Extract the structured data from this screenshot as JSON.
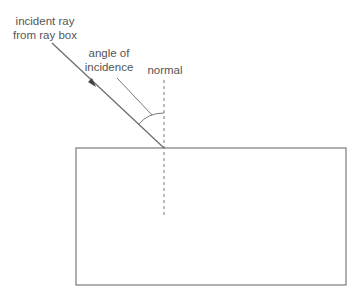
{
  "diagram": {
    "labels": {
      "incident_ray_line1": "incident ray",
      "incident_ray_line2": "from ray box",
      "angle_line1": "angle of",
      "angle_line2": "incidence",
      "normal": "normal"
    },
    "colors": {
      "line": "#7a7a7a",
      "text": "#555555",
      "background": "#ffffff"
    },
    "elements": {
      "block": {
        "x": 76,
        "y": 148,
        "width": 270,
        "height": 137
      },
      "incident_ray": {
        "x1": 52,
        "y1": 43,
        "x2": 164,
        "y2": 148,
        "arrow_at": [
          93,
          84
        ]
      },
      "normal_line": {
        "x": 164,
        "y1": 80,
        "y2": 217,
        "style": "dashed"
      },
      "angle_arc": {
        "from": [
          139,
          124
        ],
        "to": [
          164,
          113
        ]
      },
      "angle_pointer": {
        "x1": 117,
        "y1": 78,
        "x2": 152,
        "y2": 115
      }
    }
  }
}
